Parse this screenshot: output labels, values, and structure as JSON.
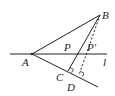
{
  "diagram": {
    "type": "geometry",
    "colors": {
      "stroke": "#222222",
      "background": "#ffffff"
    },
    "points": {
      "A": {
        "label": "A",
        "x": 32,
        "y": 54
      },
      "B": {
        "label": "B",
        "x": 100,
        "y": 15
      },
      "P": {
        "label": "P",
        "x": 73,
        "y": 54
      },
      "P_prime": {
        "label": "P′",
        "x": 85,
        "y": 54
      },
      "C": {
        "label": "C",
        "x": 68,
        "y": 71
      },
      "D": {
        "label": "D",
        "x": 79,
        "y": 75
      }
    },
    "line_label": "l",
    "segments": [
      {
        "from": "A",
        "to": "B",
        "style": "solid"
      },
      {
        "from": "B",
        "to": "C",
        "style": "solid",
        "through": "P"
      },
      {
        "from": "B",
        "to": "D",
        "style": "dashed",
        "through": "P′"
      },
      {
        "line": "l",
        "style": "solid",
        "horizontal_through": "A"
      },
      {
        "ray_from": "A",
        "through": [
          "C",
          "D"
        ],
        "style": "solid"
      }
    ],
    "right_angles": [
      "C",
      "D"
    ]
  }
}
